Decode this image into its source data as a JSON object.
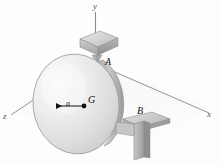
{
  "figure": {
    "background_color": "#fdfdfd",
    "ink_color": "#1a1a1a",
    "axis_color": "#7a7a7a",
    "disk_light": "#f2f2f2",
    "disk_mid": "#d8d8d8",
    "disk_dark": "#b3b3b3",
    "block_light": "#e0e0e0",
    "block_mid": "#c4c4c4",
    "block_dark": "#9e9e9e"
  },
  "axes": {
    "y_label": "y",
    "x_label": "x",
    "z_label": "z"
  },
  "points": {
    "bearing_a_label": "A",
    "bearing_b_label": "B",
    "center_of_mass_label": "G"
  },
  "dimensions": {
    "offset_label": "a"
  }
}
